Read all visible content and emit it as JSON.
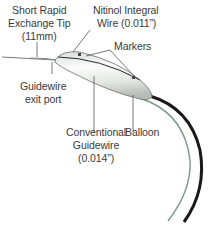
{
  "labels": {
    "tip": {
      "line1": "Short Rapid",
      "line2": "Exchange Tip",
      "line3": "(11mm)"
    },
    "nitinol": {
      "line1": "Nitinol Integral",
      "line2": "Wire (0.011”)"
    },
    "markers": "Markers",
    "exit_port": {
      "line1": "Guidewire",
      "line2": "exit port"
    },
    "guidewire": {
      "line1": "Conventional",
      "line2": "Guidewire",
      "line3": "(0.014”)"
    },
    "balloon": "Balloon"
  },
  "colors": {
    "text": "#3a3a3a",
    "leader": "#555555",
    "catheter": "#1a1a1a",
    "guidewire": "#7a9a88",
    "balloon": "#e8eae8"
  }
}
